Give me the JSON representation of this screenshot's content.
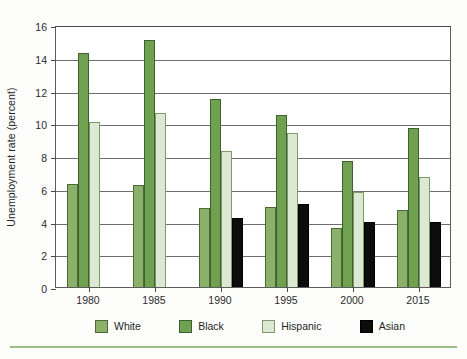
{
  "chart_data": {
    "type": "bar",
    "title": "",
    "xlabel": "",
    "ylabel": "Unemployment rate (percent)",
    "ylim": [
      0,
      16
    ],
    "ytick_step": 2,
    "yticks": [
      16,
      14,
      12,
      10,
      8,
      6,
      4,
      2,
      0
    ],
    "grid": true,
    "legend_position": "bottom",
    "categories": [
      "1980",
      "1985",
      "1990",
      "1995",
      "2000",
      "2015"
    ],
    "series": [
      {
        "name": "White",
        "color": "#8ab06a",
        "values": [
          6.3,
          6.2,
          4.8,
          4.9,
          3.6,
          4.7
        ]
      },
      {
        "name": "Black",
        "color": "#6fa150",
        "values": [
          14.3,
          15.1,
          11.5,
          10.5,
          7.7,
          9.7
        ]
      },
      {
        "name": "Hispanic",
        "color": "#dce8d2",
        "values": [
          10.1,
          10.6,
          8.3,
          9.4,
          5.8,
          6.7
        ]
      },
      {
        "name": "Asian",
        "color": "#0c0c0c",
        "values": [
          null,
          null,
          4.2,
          5.1,
          4.0,
          4.0
        ]
      }
    ]
  },
  "legend": {
    "items": [
      {
        "label": "White",
        "swatch": "white-swatch"
      },
      {
        "label": "Black",
        "swatch": "black-swatch"
      },
      {
        "label": "Hispanic",
        "swatch": "hispanic-swatch"
      },
      {
        "label": "Asian",
        "swatch": "asian-swatch"
      }
    ]
  }
}
